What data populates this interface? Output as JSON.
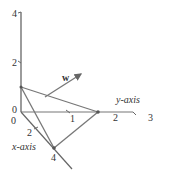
{
  "diagram": {
    "type": "3d-axes-plane",
    "axes": {
      "z": {
        "ticks": [
          "4",
          "2"
        ],
        "origin_labels": [
          "0",
          "0"
        ]
      },
      "y": {
        "label": "y-axis",
        "ticks": [
          "1",
          "2",
          "3"
        ]
      },
      "x": {
        "label": "x-axis",
        "ticks": [
          "2",
          "4"
        ]
      }
    },
    "vector": {
      "label": "w"
    },
    "colors": {
      "axis": "#555555",
      "plane": "#666666",
      "text": "#333333"
    }
  }
}
